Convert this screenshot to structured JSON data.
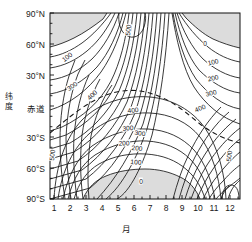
{
  "chart_data": {
    "type": "contour",
    "title": "",
    "xlabel": "月",
    "ylabel": "纬度",
    "xlim": [
      0.5,
      12.5
    ],
    "ylim": [
      -90,
      90
    ],
    "grid": false,
    "legend": "none",
    "x_ticks": [
      "1",
      "2",
      "3",
      "4",
      "5",
      "6",
      "7",
      "8",
      "9",
      "10",
      "11",
      "12"
    ],
    "x_tick_values": [
      1,
      2,
      3,
      4,
      5,
      6,
      7,
      8,
      9,
      10,
      11,
      12
    ],
    "y_ticks": [
      "90°N",
      "60°N",
      "30°N",
      "赤道",
      "30°S",
      "60°S",
      "90°S"
    ],
    "y_tick_values": [
      90,
      60,
      30,
      0,
      -30,
      -60,
      -90
    ],
    "contour_interval": 100,
    "contour_levels": [
      0,
      100,
      200,
      300,
      400,
      500
    ],
    "units_note": "",
    "shaded_region_label": "极夜（0）",
    "contour_labels": [
      {
        "text": "100",
        "x": 67,
        "y": 57,
        "rot": -38
      },
      {
        "text": "300",
        "x": 72,
        "y": 86,
        "rot": -36
      },
      {
        "text": "400",
        "x": 92,
        "y": 95,
        "rot": -44
      },
      {
        "text": "500",
        "x": 128,
        "y": 30,
        "rot": -84
      },
      {
        "text": "500",
        "x": 52,
        "y": 155,
        "rot": -84
      },
      {
        "text": "500",
        "x": 229,
        "y": 156,
        "rot": -84
      },
      {
        "text": "400",
        "x": 133,
        "y": 110,
        "rot": -5
      },
      {
        "text": "300",
        "x": 128,
        "y": 128,
        "rot": -4
      },
      {
        "text": "200",
        "x": 124,
        "y": 143,
        "rot": -3
      },
      {
        "text": "0",
        "x": 205,
        "y": 43,
        "rot": 0
      },
      {
        "text": "100",
        "x": 213,
        "y": 62,
        "rot": -12
      },
      {
        "text": "200",
        "x": 213,
        "y": 78,
        "rot": -12
      },
      {
        "text": "300",
        "x": 211,
        "y": 93,
        "rot": -14
      },
      {
        "text": "400",
        "x": 200,
        "y": 108,
        "rot": -22
      },
      {
        "text": "300",
        "x": 140,
        "y": 133,
        "rot": 8
      },
      {
        "text": "200",
        "x": 137,
        "y": 148,
        "rot": 6
      },
      {
        "text": "100",
        "x": 136,
        "y": 162,
        "rot": 4
      },
      {
        "text": "0",
        "x": 141,
        "y": 181,
        "rot": 0
      }
    ]
  }
}
